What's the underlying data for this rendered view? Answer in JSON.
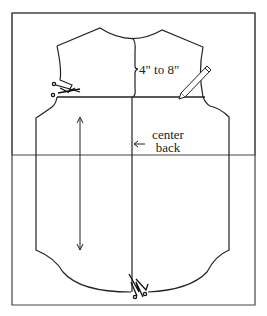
{
  "diagram": {
    "type": "sewing pattern",
    "labels": {
      "measurement": "4\" to 8\"",
      "center_back_line1": "center",
      "center_back_line2": "back"
    },
    "icons": [
      "scissors-icon",
      "pencil-icon",
      "arrow-icon"
    ],
    "colors": {
      "line": "#222222",
      "frame": "#444444",
      "background": "#ffffff"
    }
  }
}
